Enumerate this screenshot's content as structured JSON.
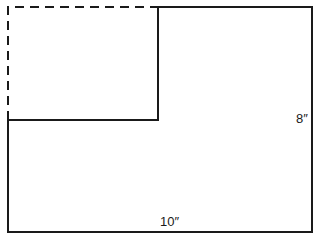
{
  "diagram": {
    "labels": {
      "height": "8″",
      "width": "10″"
    },
    "colors": {
      "stroke": "#1a1a1a",
      "background": "#ffffff"
    }
  }
}
